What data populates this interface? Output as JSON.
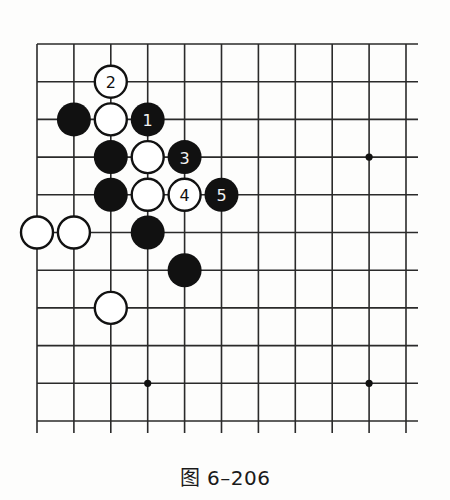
{
  "figure": {
    "caption": "图 6–206"
  },
  "board": {
    "colors": {
      "line": "#2a2a2a",
      "black_stone": "#111111",
      "white_stone": "#ffffff",
      "background": "#fdfdfc"
    },
    "grid": {
      "origin_x": 37,
      "origin_y": 44,
      "spacing_x": 36.9,
      "spacing_y": 37.7,
      "columns": 11,
      "rows": 11,
      "top_edge": true,
      "left_edge": true,
      "right_extends_to": 418,
      "bottom_extends_to": 433
    },
    "star_points": [
      {
        "col": 9,
        "row": 3
      },
      {
        "col": 3,
        "row": 9
      },
      {
        "col": 9,
        "row": 9
      }
    ],
    "stones": [
      {
        "color": "white",
        "col": 2,
        "row": 1,
        "label": "2"
      },
      {
        "color": "black",
        "col": 1,
        "row": 2,
        "label": ""
      },
      {
        "color": "white",
        "col": 2,
        "row": 2,
        "label": ""
      },
      {
        "color": "black",
        "col": 3,
        "row": 2,
        "label": "1"
      },
      {
        "color": "black",
        "col": 2,
        "row": 3,
        "label": ""
      },
      {
        "color": "white",
        "col": 3,
        "row": 3,
        "label": ""
      },
      {
        "color": "black",
        "col": 4,
        "row": 3,
        "label": "3"
      },
      {
        "color": "black",
        "col": 2,
        "row": 4,
        "label": ""
      },
      {
        "color": "white",
        "col": 3,
        "row": 4,
        "label": ""
      },
      {
        "color": "white",
        "col": 4,
        "row": 4,
        "label": "4"
      },
      {
        "color": "black",
        "col": 5,
        "row": 4,
        "label": "5"
      },
      {
        "color": "white",
        "col": 0,
        "row": 5,
        "label": ""
      },
      {
        "color": "white",
        "col": 1,
        "row": 5,
        "label": ""
      },
      {
        "color": "black",
        "col": 3,
        "row": 5,
        "label": ""
      },
      {
        "color": "black",
        "col": 4,
        "row": 6,
        "label": ""
      },
      {
        "color": "white",
        "col": 2,
        "row": 7,
        "label": ""
      }
    ],
    "stone_radius": 16.5
  }
}
